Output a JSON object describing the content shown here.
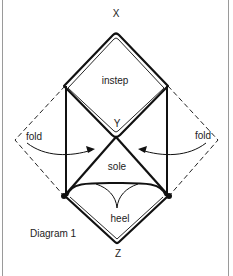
{
  "diagram": {
    "caption": "Diagram 1",
    "vertices": {
      "top": "X",
      "middle": "Y",
      "bottom": "Z"
    },
    "regions": {
      "instep": "instep",
      "sole": "sole",
      "heel": "heel"
    },
    "fold_labels": {
      "left": "fold",
      "right": "fold"
    },
    "colors": {
      "line": "#111111",
      "border": "#9a9a9a",
      "background": "#ffffff",
      "text": "#222222"
    }
  }
}
